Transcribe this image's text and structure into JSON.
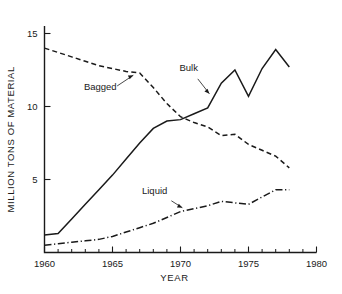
{
  "chart_data": {
    "type": "line",
    "title": "",
    "xlabel": "YEAR",
    "ylabel": "MILLION TONS OF MATERIAL",
    "xlim": [
      1960,
      1980
    ],
    "ylim": [
      0,
      16
    ],
    "xticks": [
      1960,
      1965,
      1970,
      1975,
      1980
    ],
    "xtick_labels": [
      "1960",
      "1965",
      "1970",
      "1975",
      "1980"
    ],
    "xminor_step": 1,
    "yticks": [
      5,
      10,
      15
    ],
    "ytick_labels": [
      "5",
      "10",
      "15"
    ],
    "grid": false,
    "legend_position": "inline-annotations",
    "series": [
      {
        "name": "Bagged",
        "style": "dashed",
        "label": "Bagged",
        "x": [
          1960,
          1961,
          1962,
          1963,
          1964,
          1965,
          1966,
          1967,
          1968,
          1969,
          1970,
          1971,
          1972,
          1973,
          1974,
          1975,
          1976,
          1977,
          1978
        ],
        "values": [
          14.0,
          13.7,
          13.4,
          13.1,
          12.8,
          12.6,
          12.4,
          12.3,
          11.3,
          10.2,
          9.3,
          8.9,
          8.6,
          8.0,
          8.1,
          7.4,
          7.0,
          6.6,
          5.8
        ]
      },
      {
        "name": "Bulk",
        "style": "solid",
        "label": "Bulk",
        "x": [
          1960,
          1961,
          1962,
          1963,
          1964,
          1965,
          1966,
          1967,
          1968,
          1969,
          1970,
          1971,
          1972,
          1973,
          1974,
          1975,
          1976,
          1977,
          1978
        ],
        "values": [
          1.2,
          1.3,
          2.3,
          3.3,
          4.3,
          5.3,
          6.4,
          7.5,
          8.5,
          9.0,
          9.1,
          9.5,
          9.9,
          11.6,
          12.5,
          10.7,
          12.6,
          13.9,
          12.7
        ]
      },
      {
        "name": "Liquid",
        "style": "dash-dot",
        "label": "Liquid",
        "x": [
          1960,
          1961,
          1962,
          1963,
          1964,
          1965,
          1966,
          1967,
          1968,
          1969,
          1970,
          1971,
          1972,
          1973,
          1974,
          1975,
          1976,
          1977,
          1978
        ],
        "values": [
          0.5,
          0.6,
          0.7,
          0.8,
          0.9,
          1.1,
          1.4,
          1.7,
          2.0,
          2.4,
          2.8,
          3.0,
          3.2,
          3.5,
          3.4,
          3.3,
          3.8,
          4.3,
          4.3
        ]
      }
    ],
    "annotations": [
      {
        "text": "Bagged",
        "label_x": 1964.1,
        "label_y": 11.1,
        "point_x": 1966.9,
        "point_y": 12.3
      },
      {
        "text": "Bulk",
        "label_x": 1970.6,
        "label_y": 12.4,
        "point_x": 1972.4,
        "point_y": 10.6
      },
      {
        "text": "Liquid",
        "label_x": 1968.1,
        "label_y": 4.0,
        "point_x": 1970.5,
        "point_y": 2.9
      }
    ]
  }
}
